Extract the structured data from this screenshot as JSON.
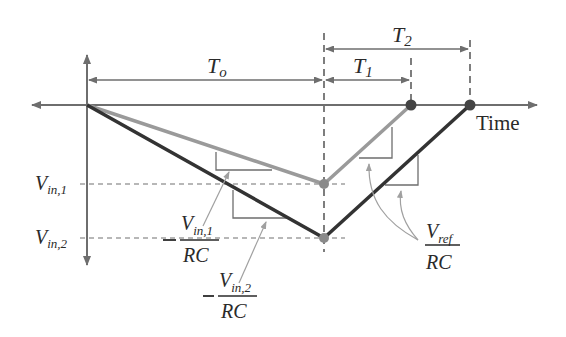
{
  "diagram": {
    "axes": {
      "x_label": "Time",
      "y_label": ""
    },
    "time_intervals": {
      "t0": {
        "main": "T",
        "sub": "o"
      },
      "t1": {
        "main": "T",
        "sub": "1"
      },
      "t2": {
        "main": "T",
        "sub": "2"
      }
    },
    "levels": {
      "vin1": {
        "main": "V",
        "sub": "in,1"
      },
      "vin2": {
        "main": "V",
        "sub": "in,2"
      }
    },
    "slopes": {
      "vin1_slope": {
        "sign": "−",
        "num_main": "V",
        "num_sub": "in,1",
        "den": "RC"
      },
      "vin2_slope": {
        "sign": "−",
        "num_main": "V",
        "num_sub": "in,2",
        "den": "RC"
      },
      "vref_slope": {
        "sign": "",
        "num_main": "V",
        "num_sub": "ref",
        "den": "RC"
      }
    },
    "colors": {
      "axis": "#6e6e6e",
      "trace_vin1": "#9a9a9a",
      "trace_vin2": "#333333",
      "dashed": "#707070",
      "marker": "#8a8a8a",
      "marker_dark": "#444444"
    }
  }
}
